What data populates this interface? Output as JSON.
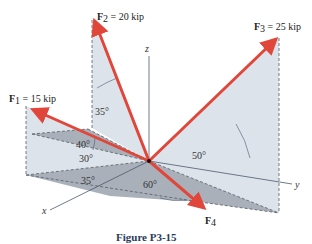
{
  "figure": {
    "caption": "Figure P3-15",
    "colors": {
      "force": "#e0473a",
      "plane_light": "#dde3ea",
      "plane_dark": "#a9b0ba",
      "axis": "#4a5a6e",
      "dashed": "#555a62",
      "caption": "#2a3a5a"
    },
    "axes": {
      "x": "x",
      "y": "y",
      "z": "z"
    },
    "forces": [
      {
        "id": "F1",
        "symbol": "F",
        "sub": "1",
        "magnitude": " = 15 kip"
      },
      {
        "id": "F2",
        "symbol": "F",
        "sub": "2",
        "magnitude": " = 20 kip"
      },
      {
        "id": "F3",
        "symbol": "F",
        "sub": "3",
        "magnitude": " = 25 kip"
      },
      {
        "id": "F4",
        "symbol": "F",
        "sub": "4",
        "magnitude": ""
      }
    ],
    "angles": {
      "a35_top": "35°",
      "a40": "40°",
      "a30": "30°",
      "a35_bottom": "35°",
      "a60": "60°",
      "a50": "50°"
    }
  }
}
